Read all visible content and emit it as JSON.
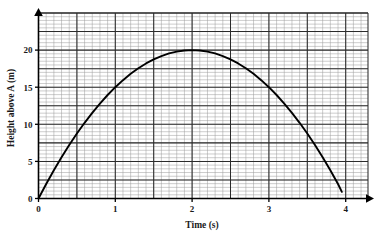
{
  "chart_data": {
    "type": "line",
    "title": "",
    "subtitle": "",
    "xlabel": "Time (s)",
    "ylabel": "Height above A (m)",
    "xlim": [
      0,
      4.3
    ],
    "ylim": [
      0,
      23
    ],
    "xticks": [
      0,
      1,
      2,
      3,
      4
    ],
    "xtick_labels": [
      "0",
      "1",
      "2",
      "3",
      "4"
    ],
    "yticks": [
      0,
      5,
      10,
      15,
      20
    ],
    "ytick_labels": [
      "0",
      "5",
      "10",
      "15",
      "20"
    ],
    "grid": true,
    "grid_minor_step_x": 0.1,
    "grid_minor_step_y": 0.5,
    "grid_major_step_x": 0.5,
    "grid_major_step_y": 2.5,
    "legend": null,
    "annotations": [],
    "series": [
      {
        "name": "Height above A",
        "type": "line",
        "color": "#000000",
        "x": [
          0,
          0.1,
          0.2,
          0.3,
          0.4,
          0.5,
          0.6,
          0.7,
          0.8,
          0.9,
          1.0,
          1.1,
          1.2,
          1.3,
          1.4,
          1.5,
          1.6,
          1.7,
          1.8,
          1.9,
          2.0,
          2.1,
          2.2,
          2.3,
          2.4,
          2.5,
          2.6,
          2.7,
          2.8,
          2.9,
          3.0,
          3.1,
          3.2,
          3.3,
          3.4,
          3.5,
          3.6,
          3.7,
          3.8,
          3.9,
          3.95
        ],
        "y": [
          0.0,
          1.95,
          3.8,
          5.55,
          7.2,
          8.75,
          10.2,
          11.55,
          12.8,
          13.95,
          15.0,
          15.95,
          16.8,
          17.55,
          18.2,
          18.75,
          19.2,
          19.55,
          19.8,
          19.95,
          20.0,
          19.95,
          19.8,
          19.55,
          19.2,
          18.75,
          18.2,
          17.55,
          16.8,
          15.95,
          15.0,
          13.95,
          12.8,
          11.55,
          10.2,
          8.75,
          7.2,
          5.55,
          3.8,
          1.95,
          0.9
        ]
      }
    ],
    "key_points": {
      "start": {
        "t": 0,
        "h": 0
      },
      "peak": {
        "t": 2.0,
        "h": 20
      },
      "end": {
        "t": 4.0,
        "h": 0
      }
    }
  },
  "colors": {
    "curve": "#000000",
    "axis": "#000000",
    "grid_minor": "#9a9a9a",
    "grid_major": "#2b2b2b",
    "background": "#ffffff",
    "text": "#1a1a1a"
  }
}
